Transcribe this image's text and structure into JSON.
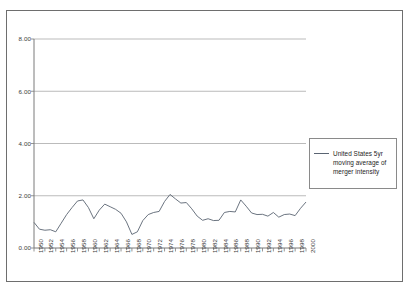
{
  "chart_data": {
    "type": "line",
    "title": "",
    "xlabel": "",
    "ylabel": "",
    "ylim": [
      0.0,
      8.0
    ],
    "xlim": [
      1950,
      2000
    ],
    "grid": true,
    "legend_position": "right",
    "y_ticks": [
      "0.00",
      "2.00",
      "4.00",
      "6.00",
      "8.00"
    ],
    "y_tick_values": [
      0.0,
      2.0,
      4.0,
      6.0,
      8.0
    ],
    "x_ticks": [
      "1950",
      "1952",
      "1954",
      "1956",
      "1958",
      "1960",
      "1962",
      "1964",
      "1966",
      "1968",
      "1970",
      "1972",
      "1974",
      "1976",
      "1978",
      "1980",
      "1982",
      "1984",
      "1986",
      "1988",
      "1990",
      "1992",
      "1994",
      "1996",
      "1998",
      "2000"
    ],
    "x_tick_values": [
      1950,
      1952,
      1954,
      1956,
      1958,
      1960,
      1962,
      1964,
      1966,
      1968,
      1970,
      1972,
      1974,
      1976,
      1978,
      1980,
      1982,
      1984,
      1986,
      1988,
      1990,
      1992,
      1994,
      1996,
      1998,
      2000
    ],
    "series": [
      {
        "name": "United States 5yr moving average of merger intensity",
        "color": "#5a6472",
        "x": [
          1950,
          1951,
          1952,
          1953,
          1954,
          1955,
          1956,
          1957,
          1958,
          1959,
          1960,
          1961,
          1962,
          1963,
          1964,
          1965,
          1966,
          1967,
          1968,
          1969,
          1970,
          1971,
          1972,
          1973,
          1974,
          1975,
          1976,
          1977,
          1978,
          1979,
          1980,
          1981,
          1982,
          1983,
          1984,
          1985,
          1986,
          1987,
          1988,
          1989,
          1990,
          1991,
          1992,
          1993,
          1994,
          1995,
          1996,
          1997,
          1998,
          1999,
          2000
        ],
        "values": [
          0.98,
          0.72,
          0.68,
          0.7,
          0.62,
          0.95,
          1.28,
          1.55,
          1.8,
          1.84,
          1.55,
          1.12,
          1.45,
          1.68,
          1.58,
          1.48,
          1.33,
          1.0,
          0.52,
          0.62,
          1.05,
          1.28,
          1.36,
          1.4,
          1.78,
          2.05,
          1.88,
          1.72,
          1.74,
          1.5,
          1.22,
          1.06,
          1.12,
          1.05,
          1.06,
          1.36,
          1.4,
          1.38,
          1.84,
          1.6,
          1.34,
          1.28,
          1.29,
          1.22,
          1.36,
          1.18,
          1.28,
          1.3,
          1.24,
          1.52,
          1.76
        ]
      }
    ]
  },
  "legend": {
    "label": "United States 5yr moving average of merger intensity"
  }
}
